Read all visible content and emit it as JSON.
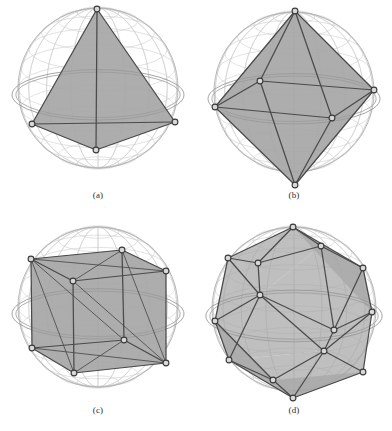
{
  "figure": {
    "type": "scientific-figure",
    "background_color": "#ffffff",
    "layout": {
      "columns": 2,
      "rows": 2
    }
  },
  "style": {
    "sphere_wire_color": "#c9c9c9",
    "sphere_outline_color": "#b0b0b0",
    "ring_color": "#9a9a9a",
    "face_fill_color": "#a6a6a6",
    "face_fill_opacity": 0.72,
    "edge_color": "#4a4a4a",
    "vertex_stroke_color": "#3a3a3a",
    "vertex_fill_color": "#d8d8d8",
    "caption_color": "#2b2b2b"
  },
  "panels": [
    {
      "id": "panel-a",
      "caption": "(a)",
      "name": "tetrahedron",
      "vertex_count": 4,
      "edge_count": 6,
      "face_count": 4,
      "sphere": {
        "cx": 98,
        "cy": 88,
        "r": 80
      },
      "vertices": [
        {
          "x": 97,
          "y": 9
        },
        {
          "x": 32,
          "y": 124
        },
        {
          "x": 175,
          "y": 122
        },
        {
          "x": 96,
          "y": 150
        }
      ],
      "edges": [
        [
          0,
          1
        ],
        [
          0,
          2
        ],
        [
          0,
          3
        ],
        [
          1,
          2
        ],
        [
          1,
          3
        ],
        [
          2,
          3
        ]
      ],
      "faces": [
        [
          0,
          1,
          2
        ],
        [
          0,
          1,
          3
        ],
        [
          0,
          2,
          3
        ],
        [
          1,
          2,
          3
        ]
      ]
    },
    {
      "id": "panel-b",
      "caption": "(b)",
      "name": "octahedron",
      "vertex_count": 6,
      "edge_count": 12,
      "face_count": 8,
      "sphere": {
        "cx": 98,
        "cy": 92,
        "r": 80
      },
      "vertices": [
        {
          "x": 99,
          "y": 11
        },
        {
          "x": 19,
          "y": 107
        },
        {
          "x": 64,
          "y": 81
        },
        {
          "x": 178,
          "y": 90
        },
        {
          "x": 136,
          "y": 118
        },
        {
          "x": 99,
          "y": 185
        }
      ],
      "edges": [
        [
          0,
          1
        ],
        [
          0,
          2
        ],
        [
          0,
          3
        ],
        [
          0,
          4
        ],
        [
          1,
          2
        ],
        [
          2,
          3
        ],
        [
          3,
          4
        ],
        [
          4,
          1
        ],
        [
          5,
          1
        ],
        [
          5,
          2
        ],
        [
          5,
          3
        ],
        [
          5,
          4
        ]
      ],
      "faces": [
        [
          0,
          1,
          2
        ],
        [
          0,
          2,
          3
        ],
        [
          0,
          3,
          4
        ],
        [
          0,
          4,
          1
        ],
        [
          5,
          1,
          2
        ],
        [
          5,
          2,
          3
        ],
        [
          5,
          3,
          4
        ],
        [
          5,
          4,
          1
        ]
      ]
    },
    {
      "id": "panel-c",
      "caption": "(c)",
      "name": "hexahedron-cube",
      "vertex_count": 8,
      "edge_count": 12,
      "face_count": 6,
      "sphere": {
        "cx": 98,
        "cy": 92,
        "r": 80
      },
      "vertices": [
        {
          "x": 31,
          "y": 44
        },
        {
          "x": 122,
          "y": 35
        },
        {
          "x": 166,
          "y": 56
        },
        {
          "x": 73,
          "y": 66
        },
        {
          "x": 32,
          "y": 133
        },
        {
          "x": 124,
          "y": 125
        },
        {
          "x": 166,
          "y": 148
        },
        {
          "x": 74,
          "y": 158
        }
      ],
      "edges": [
        [
          0,
          1
        ],
        [
          1,
          2
        ],
        [
          2,
          3
        ],
        [
          3,
          0
        ],
        [
          4,
          5
        ],
        [
          5,
          6
        ],
        [
          6,
          7
        ],
        [
          7,
          4
        ],
        [
          0,
          4
        ],
        [
          1,
          5
        ],
        [
          2,
          6
        ],
        [
          3,
          7
        ]
      ],
      "diagonals": [
        [
          0,
          2
        ],
        [
          1,
          3
        ],
        [
          4,
          6
        ],
        [
          5,
          7
        ],
        [
          0,
          5
        ],
        [
          3,
          6
        ],
        [
          1,
          6
        ],
        [
          0,
          7
        ]
      ],
      "faces": [
        [
          0,
          1,
          2,
          3
        ],
        [
          4,
          5,
          6,
          7
        ],
        [
          0,
          1,
          5,
          4
        ],
        [
          1,
          2,
          6,
          5
        ],
        [
          2,
          3,
          7,
          6
        ],
        [
          3,
          0,
          4,
          7
        ]
      ]
    },
    {
      "id": "panel-d",
      "caption": "(d)",
      "name": "icosahedron",
      "vertex_count": 12,
      "edge_count": 30,
      "face_count": 20,
      "sphere": {
        "cx": 98,
        "cy": 94,
        "r": 82
      },
      "vertices": [
        {
          "x": 97,
          "y": 12
        },
        {
          "x": 32,
          "y": 43
        },
        {
          "x": 125,
          "y": 31
        },
        {
          "x": 167,
          "y": 53
        },
        {
          "x": 62,
          "y": 48
        },
        {
          "x": 64,
          "y": 80
        },
        {
          "x": 19,
          "y": 106
        },
        {
          "x": 138,
          "y": 115
        },
        {
          "x": 176,
          "y": 97
        },
        {
          "x": 33,
          "y": 145
        },
        {
          "x": 128,
          "y": 136
        },
        {
          "x": 77,
          "y": 165
        },
        {
          "x": 167,
          "y": 157
        },
        {
          "x": 97,
          "y": 183
        }
      ],
      "edges": [
        [
          0,
          1
        ],
        [
          0,
          2
        ],
        [
          0,
          4
        ],
        [
          1,
          4
        ],
        [
          2,
          4
        ],
        [
          2,
          3
        ],
        [
          1,
          6
        ],
        [
          4,
          5
        ],
        [
          5,
          6
        ],
        [
          2,
          7
        ],
        [
          3,
          7
        ],
        [
          3,
          8
        ],
        [
          7,
          8
        ],
        [
          5,
          7
        ],
        [
          6,
          9
        ],
        [
          9,
          11
        ],
        [
          5,
          9
        ],
        [
          7,
          10
        ],
        [
          10,
          12
        ],
        [
          8,
          12
        ],
        [
          10,
          11
        ],
        [
          11,
          13
        ],
        [
          13,
          12
        ],
        [
          9,
          13
        ],
        [
          10,
          13
        ],
        [
          0,
          3
        ],
        [
          1,
          5
        ],
        [
          6,
          11
        ],
        [
          8,
          10
        ],
        [
          5,
          10
        ]
      ],
      "faces": [
        [
          0,
          1,
          4
        ],
        [
          0,
          4,
          2
        ],
        [
          0,
          2,
          3
        ],
        [
          1,
          4,
          5
        ],
        [
          1,
          5,
          6
        ],
        [
          2,
          4,
          5
        ],
        [
          2,
          5,
          7
        ],
        [
          2,
          7,
          3
        ],
        [
          3,
          7,
          8
        ],
        [
          5,
          6,
          9
        ],
        [
          5,
          9,
          10
        ],
        [
          5,
          10,
          7
        ],
        [
          7,
          10,
          8
        ],
        [
          8,
          10,
          12
        ],
        [
          6,
          9,
          11
        ],
        [
          9,
          11,
          13
        ],
        [
          9,
          13,
          10
        ],
        [
          10,
          13,
          12
        ],
        [
          11,
          13,
          12
        ],
        [
          0,
          3,
          8
        ]
      ]
    }
  ]
}
